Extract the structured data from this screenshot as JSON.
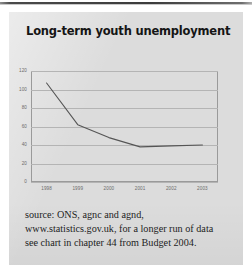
{
  "page": {
    "background_color": "#ffffff",
    "panel_color": "#dcdcdc",
    "rule_color": "#3c3c3c"
  },
  "figure": {
    "title": "Long-term youth unemployment",
    "caption_lines": [
      "source: ONS, agnc and agnd,",
      "www.statistics.gov.uk, for a longer run of data",
      "see chart in chapter 44 from Budget 2004."
    ]
  },
  "chart_data": {
    "type": "line",
    "title": "Long-term youth unemployment",
    "xlabel": "",
    "ylabel": "",
    "categories": [
      "1998",
      "1999",
      "2000",
      "2001",
      "2002",
      "2003"
    ],
    "series": [
      {
        "name": "Long-term youth unemployment",
        "values": [
          107,
          62,
          48,
          38,
          39,
          40
        ],
        "color": "#555555"
      }
    ],
    "ylim": [
      0,
      120
    ],
    "yticks": [
      "0",
      "20",
      "40",
      "60",
      "80",
      "100",
      "120"
    ],
    "ytick_values": [
      0,
      20,
      40,
      60,
      80,
      100,
      120
    ],
    "grid": "horizontal",
    "legend": "none",
    "frame_color": "#9a9a9a",
    "grid_color": "#b4b4b4"
  }
}
